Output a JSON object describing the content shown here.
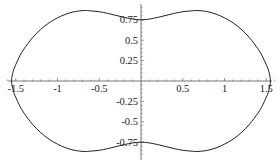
{
  "chart_data": {
    "type": "line",
    "title": "",
    "xlabel": "",
    "ylabel": "",
    "xlim": [
      -1.6,
      1.6
    ],
    "ylim": [
      -0.9,
      0.9
    ],
    "grid": false,
    "legend": null,
    "x_ticks": [
      -1.5,
      -1,
      -0.5,
      0.5,
      1,
      1.5
    ],
    "x_tick_labels": [
      "-1.5",
      "-1",
      "-0.5",
      "0.5",
      "1",
      "1.5"
    ],
    "y_ticks": [
      0.75,
      0.5,
      0.25,
      -0.25,
      -0.5,
      -0.75
    ],
    "y_tick_labels": [
      "0.75",
      "0.5",
      "0.25",
      "-0.25",
      "-0.5",
      "-0.75"
    ],
    "series": [
      {
        "name": "curve",
        "color": "#222222",
        "x": [
          0,
          0.1,
          0.2,
          0.3,
          0.4,
          0.5,
          0.6,
          0.68,
          0.8,
          0.9,
          1.0,
          1.1,
          1.2,
          1.3,
          1.4,
          1.45,
          1.5,
          1.53,
          1.55
        ],
        "y_upper": [
          0.75,
          0.76,
          0.78,
          0.805,
          0.83,
          0.85,
          0.86,
          0.865,
          0.85,
          0.82,
          0.775,
          0.715,
          0.635,
          0.53,
          0.395,
          0.31,
          0.2,
          0.12,
          0.0
        ]
      }
    ],
    "symmetry": "curve mirrored in both x and y axes"
  },
  "axes": {
    "origin_px": [
      141,
      81
    ],
    "px_per_unit_x": 83.5,
    "px_per_unit_y": 81.5,
    "color": "#555555"
  }
}
